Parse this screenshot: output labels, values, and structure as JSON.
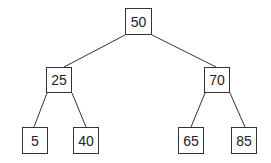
{
  "tree": {
    "nodes": [
      {
        "id": "n50",
        "label": "50",
        "x": 125,
        "y": 8,
        "w": 27,
        "h": 27
      },
      {
        "id": "n25",
        "label": "25",
        "x": 46,
        "y": 67,
        "w": 26,
        "h": 26
      },
      {
        "id": "n70",
        "label": "70",
        "x": 204,
        "y": 67,
        "w": 26,
        "h": 26
      },
      {
        "id": "n5",
        "label": "5",
        "x": 22,
        "y": 127,
        "w": 26,
        "h": 27
      },
      {
        "id": "n40",
        "label": "40",
        "x": 73,
        "y": 127,
        "w": 26,
        "h": 27
      },
      {
        "id": "n65",
        "label": "65",
        "x": 178,
        "y": 127,
        "w": 26,
        "h": 27
      },
      {
        "id": "n85",
        "label": "85",
        "x": 231,
        "y": 127,
        "w": 26,
        "h": 27
      }
    ],
    "edges": [
      {
        "from": "n50",
        "to": "n25",
        "x1": 125,
        "y1": 35,
        "x2": 64,
        "y2": 67
      },
      {
        "from": "n50",
        "to": "n70",
        "x1": 152,
        "y1": 35,
        "x2": 216,
        "y2": 67
      },
      {
        "from": "n25",
        "to": "n5",
        "x1": 47,
        "y1": 93,
        "x2": 34,
        "y2": 127
      },
      {
        "from": "n25",
        "to": "n40",
        "x1": 72,
        "y1": 93,
        "x2": 86,
        "y2": 127
      },
      {
        "from": "n70",
        "to": "n65",
        "x1": 205,
        "y1": 93,
        "x2": 191,
        "y2": 127
      },
      {
        "from": "n70",
        "to": "n85",
        "x1": 230,
        "y1": 93,
        "x2": 245,
        "y2": 127
      }
    ]
  }
}
